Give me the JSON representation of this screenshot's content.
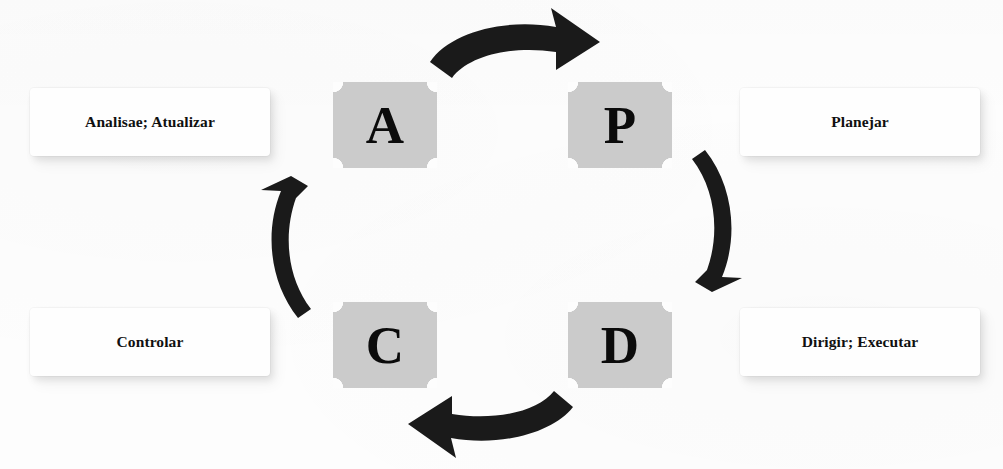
{
  "diagram": {
    "type": "cycle-diagram",
    "background_color": "#fdfdfd",
    "tile_color": "#cbcbcb",
    "arrow_color": "#1a1a1a",
    "text_color": "#101010"
  },
  "tiles": [
    {
      "id": "a",
      "letter": "A",
      "position": "top-left"
    },
    {
      "id": "p",
      "letter": "P",
      "position": "top-right"
    },
    {
      "id": "c",
      "letter": "C",
      "position": "bottom-left"
    },
    {
      "id": "d",
      "letter": "D",
      "position": "bottom-right"
    }
  ],
  "labels": {
    "analisar": "Analisae; Atualizar",
    "planejar": "Planejar",
    "controlar": "Controlar",
    "dirigir": "Dirigir; Executar"
  },
  "arrows": [
    {
      "id": "top",
      "from": "A",
      "to": "P",
      "direction": "right",
      "shape": "curved"
    },
    {
      "id": "right",
      "from": "P",
      "to": "D",
      "direction": "down",
      "shape": "curved"
    },
    {
      "id": "bottom",
      "from": "D",
      "to": "C",
      "direction": "left",
      "shape": "curved"
    },
    {
      "id": "left",
      "from": "C",
      "to": "A",
      "direction": "up",
      "shape": "curved"
    }
  ]
}
